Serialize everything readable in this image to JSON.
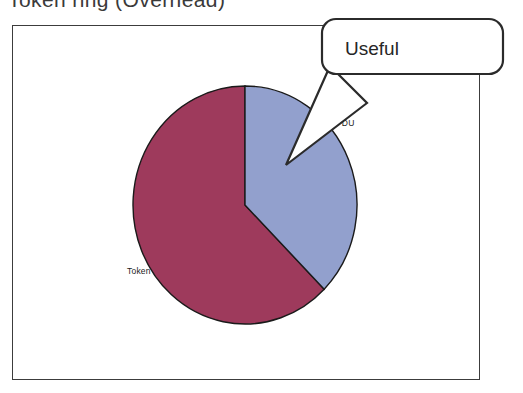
{
  "slide": {
    "title": "Token   ring   (Overhead)"
  },
  "chart_data": {
    "type": "pie",
    "title": "Token ring (Overhead)",
    "categories": [
      "Token",
      "PDU"
    ],
    "values": [
      62.5,
      37.5
    ],
    "labels": [
      "Token",
      "PDU"
    ],
    "colors": [
      "#9e3a5c",
      "#92a0cd"
    ],
    "start_angle": 0,
    "direction": "clockwise",
    "legend": "none",
    "grid": false,
    "xlabel": "",
    "ylabel": "",
    "annotations": [
      {
        "text": "Useful",
        "points_to": "PDU"
      }
    ]
  },
  "pie": {
    "slices": [
      {
        "name": "token-slice",
        "label": "Token",
        "color": "#9e3a5c",
        "percent": 62.5
      },
      {
        "name": "pdu-slice",
        "label": "PDU",
        "color": "#92a0cd",
        "percent": 37.5
      }
    ],
    "outline_color": "#1a1a1a",
    "center_x": 245,
    "center_y": 205,
    "radius_x": 112,
    "radius_y": 119
  },
  "callout": {
    "text": "Useful",
    "border_color": "#2b2b2b",
    "fill_color": "#ffffff"
  },
  "frame": {
    "border_color": "#3c3c3c",
    "fill_color": "#ffffff"
  }
}
